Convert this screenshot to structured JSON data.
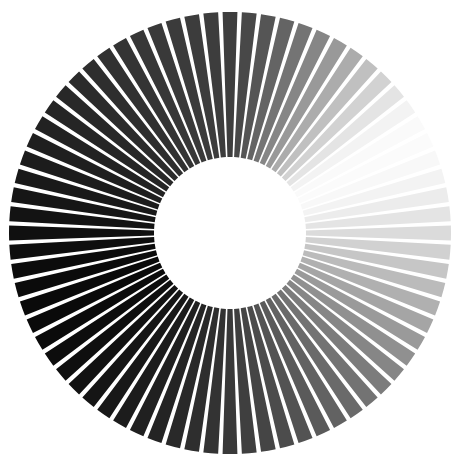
{
  "figure": {
    "name": "radial-spoke-gradient-disc",
    "background_color": "#ffffff",
    "gap_color": "#ffffff",
    "width": 462,
    "height": 464
  },
  "chart_data": {
    "type": "pie",
    "title": "",
    "subtitle": "",
    "xlabel": "",
    "ylabel": "",
    "grid": false,
    "legend_position": "none",
    "geometry": {
      "center_x": 230,
      "center_y": 233,
      "outer_radius": 221,
      "inner_radius": 76,
      "spoke_count": 72,
      "sector_span_deg": 5.0,
      "gap_deg": 1.15,
      "start_angle_deg": -90
    },
    "colormap": {
      "name": "cyclic-grayscale",
      "min_hex": "#0a0a0a",
      "max_hex": "#fbfbfb",
      "peak_bright_angle_deg": 55,
      "peak_dark_angle_deg": 235
    },
    "categories": [
      "s01",
      "s02",
      "s03",
      "s04",
      "s05",
      "s06",
      "s07",
      "s08",
      "s09",
      "s10",
      "s11",
      "s12",
      "s13",
      "s14",
      "s15",
      "s16",
      "s17",
      "s18",
      "s19",
      "s20",
      "s21",
      "s22",
      "s23",
      "s24",
      "s25",
      "s26",
      "s27",
      "s28",
      "s29",
      "s30",
      "s31",
      "s32",
      "s33",
      "s34",
      "s35",
      "s36",
      "s37",
      "s38",
      "s39",
      "s40",
      "s41",
      "s42",
      "s43",
      "s44",
      "s45",
      "s46",
      "s47",
      "s48",
      "s49",
      "s50",
      "s51",
      "s52",
      "s53",
      "s54",
      "s55",
      "s56",
      "s57",
      "s58",
      "s59",
      "s60",
      "s61",
      "s62",
      "s63",
      "s64",
      "s65",
      "s66",
      "s67",
      "s68",
      "s69",
      "s70",
      "s71",
      "s72"
    ],
    "angles_deg": [
      0,
      5,
      10,
      15,
      20,
      25,
      30,
      35,
      40,
      45,
      50,
      55,
      60,
      65,
      70,
      75,
      80,
      85,
      90,
      95,
      100,
      105,
      110,
      115,
      120,
      125,
      130,
      135,
      140,
      145,
      150,
      155,
      160,
      165,
      170,
      175,
      180,
      185,
      190,
      195,
      200,
      205,
      210,
      215,
      220,
      225,
      230,
      235,
      240,
      245,
      250,
      255,
      260,
      265,
      270,
      275,
      280,
      285,
      290,
      295,
      300,
      305,
      310,
      315,
      320,
      325,
      330,
      335,
      340,
      345,
      350,
      355
    ],
    "values": [
      62,
      72,
      85,
      100,
      116,
      134,
      153,
      172,
      192,
      210,
      228,
      243,
      250,
      251,
      248,
      243,
      236,
      228,
      219,
      209,
      198,
      187,
      176,
      165,
      154,
      144,
      134,
      124,
      115,
      106,
      98,
      90,
      83,
      76,
      69,
      63,
      57,
      51,
      46,
      41,
      36,
      32,
      28,
      24,
      21,
      18,
      15,
      13,
      11,
      10,
      10,
      11,
      12,
      14,
      16,
      19,
      22,
      25,
      28,
      31,
      34,
      37,
      40,
      43,
      46,
      49,
      52,
      55,
      57,
      59,
      60,
      61
    ],
    "colors": [
      "#3e3e3e",
      "#484848",
      "#555555",
      "#646464",
      "#747474",
      "#868686",
      "#999999",
      "#acacac",
      "#c0c0c0",
      "#d2d2d2",
      "#e4e4e4",
      "#f3f3f3",
      "#fafafa",
      "#fbfbfb",
      "#f8f8f8",
      "#f3f3f3",
      "#ececec",
      "#e4e4e4",
      "#dbdbdb",
      "#d1d1d1",
      "#c6c6c6",
      "#bbbbbb",
      "#b0b0b0",
      "#a5a5a5",
      "#9a9a9a",
      "#909090",
      "#868686",
      "#7c7c7c",
      "#737373",
      "#6a6a6a",
      "#626262",
      "#5a5a5a",
      "#535353",
      "#4c4c4c",
      "#454545",
      "#3f3f3f",
      "#393939",
      "#333333",
      "#2e2e2e",
      "#292929",
      "#242424",
      "#202020",
      "#1c1c1c",
      "#181818",
      "#151515",
      "#121212",
      "#0f0f0f",
      "#0d0d0d",
      "#0b0b0b",
      "#0a0a0a",
      "#0a0a0a",
      "#0b0b0b",
      "#0c0c0c",
      "#0e0e0e",
      "#101010",
      "#131313",
      "#161616",
      "#191919",
      "#1c1c1c",
      "#1f1f1f",
      "#222222",
      "#252525",
      "#282828",
      "#2b2b2b",
      "#2e2e2e",
      "#313131",
      "#343434",
      "#373737",
      "#393939",
      "#3b3b3b",
      "#3c3c3c",
      "#3d3d3d"
    ]
  }
}
